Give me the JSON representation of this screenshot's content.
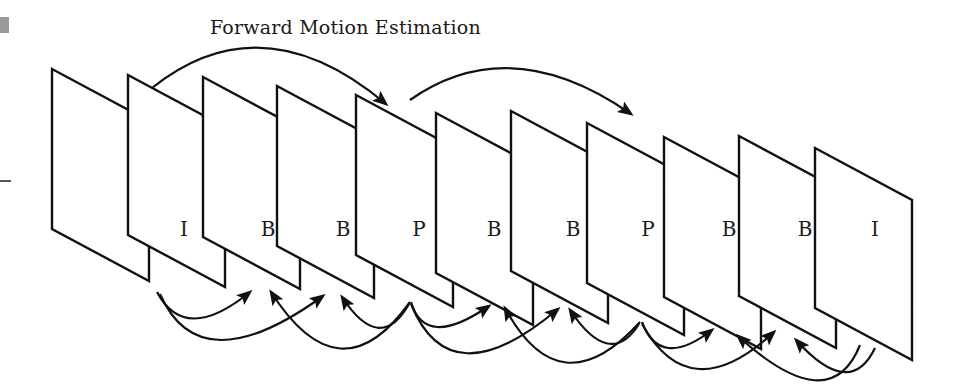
{
  "diagram": {
    "title": "Forward Motion Estimation",
    "frame_geometry": {
      "width": 97,
      "height": 160,
      "slant": 52
    },
    "frames": [
      {
        "x": 52,
        "y": 69,
        "label": ""
      },
      {
        "x": 128,
        "y": 75,
        "label": "I"
      },
      {
        "x": 203,
        "y": 77,
        "label": "B"
      },
      {
        "x": 277,
        "y": 86,
        "label": "B"
      },
      {
        "x": 356,
        "y": 95,
        "label": "P"
      },
      {
        "x": 436,
        "y": 113,
        "label": "B"
      },
      {
        "x": 511,
        "y": 111,
        "label": "B"
      },
      {
        "x": 587,
        "y": 123,
        "label": "P"
      },
      {
        "x": 664,
        "y": 137,
        "label": "B"
      },
      {
        "x": 739,
        "y": 136,
        "label": "B"
      },
      {
        "x": 815,
        "y": 148,
        "label": "I"
      }
    ],
    "labels": [
      {
        "text": "I",
        "x": 184,
        "y": 229
      },
      {
        "text": "B",
        "x": 268,
        "y": 229
      },
      {
        "text": "B",
        "x": 343,
        "y": 229
      },
      {
        "text": "P",
        "x": 419,
        "y": 229
      },
      {
        "text": "B",
        "x": 494,
        "y": 229
      },
      {
        "text": "B",
        "x": 573,
        "y": 229
      },
      {
        "text": "P",
        "x": 648,
        "y": 229
      },
      {
        "text": "B",
        "x": 729,
        "y": 229
      },
      {
        "text": "B",
        "x": 805,
        "y": 229
      },
      {
        "text": "I",
        "x": 875,
        "y": 229
      }
    ],
    "forward_arrows": [
      {
        "from": "I",
        "to": "P",
        "d": "M152,88 Q262,0 386,104"
      },
      {
        "from": "P",
        "to": "P",
        "d": "M410,100 Q510,30 631,114"
      }
    ],
    "bidirectional_arrows": [
      {
        "from": "I",
        "to": "B",
        "d": "M157,292 Q185,345 250,292"
      },
      {
        "from": "I",
        "to": "B",
        "d": "M160,294 Q200,385 323,296"
      },
      {
        "from": "P",
        "to": "B",
        "d": "M410,302 Q340,400 271,292"
      },
      {
        "from": "P",
        "to": "B",
        "d": "M409,304 Q380,355 342,297"
      },
      {
        "from": "P",
        "to": "B",
        "d": "M411,302 Q425,350 489,306"
      },
      {
        "from": "P",
        "to": "B",
        "d": "M411,304 Q450,400 558,309"
      },
      {
        "from": "P",
        "to": "B",
        "d": "M640,322 Q560,410 505,308"
      },
      {
        "from": "P",
        "to": "B",
        "d": "M639,324 Q610,370 570,310"
      },
      {
        "from": "P",
        "to": "B",
        "d": "M642,322 Q660,370 712,330"
      },
      {
        "from": "P",
        "to": "B",
        "d": "M642,324 Q690,410 774,332"
      },
      {
        "from": "I",
        "to": "B",
        "d": "M860,345 Q830,420 738,336"
      },
      {
        "from": "I",
        "to": "B",
        "d": "M875,348 Q850,400 796,340"
      }
    ],
    "colors": {
      "stroke": "#111111",
      "background": "#ffffff"
    }
  }
}
